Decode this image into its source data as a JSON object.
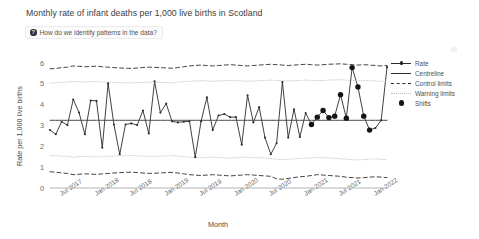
{
  "header": {
    "title": "Monthly rate of infant deaths per 1,000 live births in Scotland",
    "info_button_label": "How do we identify patterns in the data?",
    "info_icon_glyph": "?",
    "menu_icon_name": "more-options-icon"
  },
  "legend": {
    "items": [
      {
        "label": "Rate",
        "key": "line-marker"
      },
      {
        "label": "Centreline",
        "key": "solid-line"
      },
      {
        "label": "Control limits",
        "key": "dashed-line"
      },
      {
        "label": "Warning limits",
        "key": "dotted-line"
      },
      {
        "label": "Shifts",
        "key": "big-dot"
      }
    ]
  },
  "colors": {
    "rate_line": "#2b2b2b",
    "centreline": "#4a4a4a",
    "control_limits": "#3a3a3a",
    "warning_limits": "#c9c9c9",
    "shift_marker": "#141414",
    "axis": "#b0b0b0",
    "text": "#5f5f5f"
  },
  "chart_data": {
    "type": "line",
    "title": "Monthly rate of infant deaths per 1,000 live births in Scotland",
    "xlabel": "Month",
    "ylabel": "Rate per 1,000 live births",
    "ylim": [
      0,
      6
    ],
    "yticks": [
      0,
      1,
      2,
      3,
      4,
      5,
      6
    ],
    "ytick_labels": [
      "0",
      "1",
      "2",
      "3",
      "4",
      "5",
      "6"
    ],
    "grid": false,
    "legend_position": "right",
    "xtick_labels": [
      "Jul 2017",
      "Jan 2018",
      "Jul 2018",
      "Jan 2019",
      "Jul 2019",
      "Jan 2020",
      "Jul 2020",
      "Jan 2021",
      "Jul 2021",
      "Jan 2022"
    ],
    "xtick_indices": [
      2,
      8,
      14,
      20,
      26,
      32,
      38,
      44,
      50,
      56
    ],
    "x_start_label": "May 2017",
    "x_end_label": "Mar 2022",
    "n_points": 59,
    "series": [
      {
        "name": "Rate",
        "values": [
          2.78,
          2.58,
          3.18,
          3.02,
          4.25,
          3.62,
          2.58,
          4.2,
          4.18,
          1.93,
          5.02,
          3.05,
          1.62,
          3.05,
          3.1,
          3.02,
          3.72,
          2.62,
          5.12,
          3.62,
          4.05,
          3.2,
          3.15,
          3.18,
          3.2,
          1.48,
          3.2,
          4.35,
          2.78,
          3.48,
          3.55,
          3.4,
          3.4,
          2.08,
          4.45,
          3.15,
          3.88,
          2.42,
          1.62,
          2.15,
          5.08,
          2.42,
          3.78,
          2.45,
          3.6,
          3.05,
          3.4,
          3.72,
          3.38,
          3.45,
          4.48,
          3.35,
          5.78,
          4.85,
          3.45,
          2.78,
          2.88,
          3.25,
          5.8
        ]
      },
      {
        "name": "Centreline",
        "style": "solid",
        "values": [
          3.25,
          3.25,
          3.25,
          3.25,
          3.25,
          3.25,
          3.25,
          3.25,
          3.25,
          3.25,
          3.25,
          3.25,
          3.25,
          3.25,
          3.25,
          3.25,
          3.25,
          3.25,
          3.25,
          3.25,
          3.25,
          3.25,
          3.25,
          3.25,
          3.25,
          3.25,
          3.25,
          3.25,
          3.25,
          3.25,
          3.25,
          3.25,
          3.25,
          3.25,
          3.25,
          3.25,
          3.25,
          3.25,
          3.25,
          3.25,
          3.25,
          3.25,
          3.25,
          3.25,
          3.25,
          3.25,
          3.25,
          3.25,
          3.25,
          3.25,
          3.25,
          3.25,
          3.25,
          3.25,
          3.25,
          3.25,
          3.25,
          3.25,
          3.25
        ]
      },
      {
        "name": "Upper control limit",
        "style": "dashed",
        "values": [
          5.72,
          5.74,
          5.78,
          5.8,
          5.86,
          5.84,
          5.82,
          5.83,
          5.85,
          5.82,
          5.8,
          5.78,
          5.76,
          5.75,
          5.74,
          5.76,
          5.78,
          5.8,
          5.79,
          5.78,
          5.76,
          5.75,
          5.78,
          5.82,
          5.86,
          5.88,
          5.9,
          5.88,
          5.86,
          5.88,
          5.9,
          5.92,
          5.9,
          5.88,
          5.86,
          5.88,
          5.9,
          5.92,
          5.94,
          5.92,
          5.9,
          5.88,
          5.9,
          5.92,
          5.94,
          5.92,
          5.9,
          5.92,
          5.94,
          5.95,
          5.96,
          5.94,
          5.92,
          5.9,
          5.92,
          5.9,
          5.88,
          5.86,
          5.88
        ]
      },
      {
        "name": "Lower control limit",
        "style": "dashed",
        "values": [
          0.78,
          0.76,
          0.72,
          0.7,
          0.64,
          0.66,
          0.68,
          0.67,
          0.65,
          0.68,
          0.7,
          0.72,
          0.74,
          0.75,
          0.76,
          0.74,
          0.72,
          0.7,
          0.71,
          0.72,
          0.74,
          0.75,
          0.72,
          0.68,
          0.64,
          0.62,
          0.6,
          0.62,
          0.64,
          0.62,
          0.6,
          0.58,
          0.6,
          0.62,
          0.64,
          0.62,
          0.6,
          0.58,
          0.56,
          0.44,
          0.42,
          0.46,
          0.5,
          0.54,
          0.56,
          0.6,
          0.64,
          0.62,
          0.6,
          0.58,
          0.56,
          0.52,
          0.5,
          0.48,
          0.5,
          0.52,
          0.54,
          0.52,
          0.5
        ]
      },
      {
        "name": "Upper warning limit",
        "style": "dotted",
        "values": [
          5.04,
          5.05,
          5.07,
          5.08,
          5.12,
          5.1,
          5.09,
          5.1,
          5.11,
          5.09,
          5.08,
          5.07,
          5.06,
          5.05,
          5.04,
          5.06,
          5.07,
          5.08,
          5.08,
          5.07,
          5.06,
          5.05,
          5.07,
          5.1,
          5.12,
          5.14,
          5.15,
          5.14,
          5.12,
          5.14,
          5.15,
          5.16,
          5.15,
          5.14,
          5.12,
          5.14,
          5.15,
          5.16,
          5.18,
          5.16,
          5.15,
          5.14,
          5.15,
          5.16,
          5.18,
          5.16,
          5.15,
          5.16,
          5.18,
          5.19,
          5.2,
          5.18,
          5.16,
          5.15,
          5.16,
          5.15,
          5.14,
          5.12,
          5.14
        ]
      },
      {
        "name": "Lower warning limit",
        "style": "dotted",
        "values": [
          1.56,
          1.55,
          1.53,
          1.52,
          1.48,
          1.5,
          1.51,
          1.5,
          1.49,
          1.51,
          1.52,
          1.53,
          1.54,
          1.55,
          1.56,
          1.54,
          1.53,
          1.52,
          1.52,
          1.53,
          1.54,
          1.55,
          1.53,
          1.5,
          1.48,
          1.46,
          1.45,
          1.46,
          1.48,
          1.46,
          1.45,
          1.44,
          1.45,
          1.46,
          1.48,
          1.46,
          1.45,
          1.44,
          1.42,
          1.38,
          1.36,
          1.38,
          1.4,
          1.42,
          1.44,
          1.45,
          1.46,
          1.45,
          1.44,
          1.42,
          1.4,
          1.38,
          1.36,
          1.35,
          1.36,
          1.38,
          1.4,
          1.38,
          1.36
        ]
      }
    ],
    "shift_indices": [
      45,
      46,
      47,
      48,
      49,
      50,
      51,
      52,
      53,
      54,
      55
    ],
    "shift_points": [
      {
        "index": 45,
        "value": 3.05
      },
      {
        "index": 46,
        "value": 3.4
      },
      {
        "index": 47,
        "value": 3.72
      },
      {
        "index": 48,
        "value": 3.38
      },
      {
        "index": 49,
        "value": 3.45
      },
      {
        "index": 50,
        "value": 4.48
      },
      {
        "index": 51,
        "value": 3.35
      },
      {
        "index": 52,
        "value": 5.78
      },
      {
        "index": 53,
        "value": 4.85
      },
      {
        "index": 54,
        "value": 3.45
      },
      {
        "index": 55,
        "value": 2.78
      }
    ]
  }
}
